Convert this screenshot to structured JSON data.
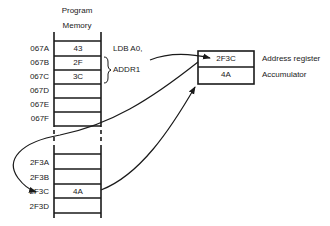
{
  "header": {
    "line1": "Program",
    "line2": "Memory"
  },
  "memory_top": [
    {
      "address": "067A",
      "value": "43"
    },
    {
      "address": "067B",
      "value": "2F"
    },
    {
      "address": "067C",
      "value": "3C"
    },
    {
      "address": "067D",
      "value": ""
    },
    {
      "address": "067E",
      "value": ""
    },
    {
      "address": "067F",
      "value": ""
    }
  ],
  "memory_bottom": [
    {
      "address": "2F3A",
      "value": ""
    },
    {
      "address": "2F3B",
      "value": ""
    },
    {
      "address": "2F3C",
      "value": "4A"
    },
    {
      "address": "2F3D",
      "value": ""
    }
  ],
  "instruction": {
    "opcode": "LDB A0,",
    "operand": "ADDR1"
  },
  "registers": [
    {
      "value": "2F3C",
      "label": "Address register"
    },
    {
      "value": "4A",
      "label": "Accumulator"
    }
  ],
  "colors": {
    "line": "#1a1a1a",
    "background": "#ffffff"
  }
}
